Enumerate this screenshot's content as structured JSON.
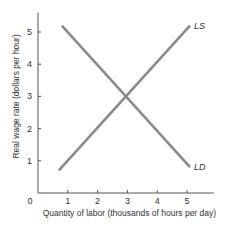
{
  "chart_data": {
    "type": "line",
    "title": "",
    "xlabel": "Quantity of labor (thousands of hours per day)",
    "ylabel": "Real wage rate (dollars per hour)",
    "xlim": [
      0,
      6
    ],
    "ylim": [
      0,
      5.6
    ],
    "xticks": [
      1,
      2,
      3,
      4,
      5
    ],
    "yticks": [
      1,
      2,
      3,
      4,
      5
    ],
    "origin_label": "0",
    "grid": false,
    "legend": "none (series labeled at line ends)",
    "series": [
      {
        "name": "LD",
        "label": "LD",
        "color": "#8a8a8a",
        "points": [
          [
            0.8,
            5.2
          ],
          [
            5.1,
            0.8
          ]
        ]
      },
      {
        "name": "LS",
        "label": "LS",
        "color": "#8a8a8a",
        "points": [
          [
            0.7,
            0.7
          ],
          [
            5.1,
            5.2
          ]
        ]
      }
    ],
    "intersection": [
      3,
      3
    ]
  }
}
